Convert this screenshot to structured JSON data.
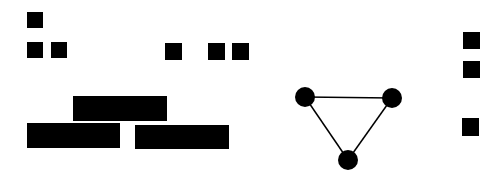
{
  "canvas": {
    "width": 503,
    "height": 177,
    "background": "#ffffff",
    "foreground": "#000000"
  },
  "squares": [
    {
      "id": "sq-top-left",
      "x": 27,
      "y": 12,
      "w": 16,
      "h": 16
    },
    {
      "id": "sq-row2-a",
      "x": 27,
      "y": 42,
      "w": 16,
      "h": 16
    },
    {
      "id": "sq-row2-b",
      "x": 51,
      "y": 42,
      "w": 16,
      "h": 16
    },
    {
      "id": "sq-mid-a",
      "x": 165,
      "y": 43,
      "w": 17,
      "h": 17
    },
    {
      "id": "sq-mid-b",
      "x": 208,
      "y": 43,
      "w": 17,
      "h": 17
    },
    {
      "id": "sq-mid-c",
      "x": 232,
      "y": 43,
      "w": 17,
      "h": 17
    },
    {
      "id": "sq-right-a",
      "x": 463,
      "y": 32,
      "w": 17,
      "h": 17
    },
    {
      "id": "sq-right-b",
      "x": 463,
      "y": 61,
      "w": 17,
      "h": 17
    },
    {
      "id": "sq-right-c",
      "x": 462,
      "y": 118,
      "w": 17,
      "h": 18
    }
  ],
  "bars": [
    {
      "id": "bar-top",
      "x": 73,
      "y": 96,
      "w": 94,
      "h": 25
    },
    {
      "id": "bar-bottom-left",
      "x": 27,
      "y": 123,
      "w": 93,
      "h": 25
    },
    {
      "id": "bar-bottom-right",
      "x": 135,
      "y": 125,
      "w": 94,
      "h": 24
    }
  ],
  "graph": {
    "nodes": [
      {
        "id": "node-a",
        "cx": 305,
        "cy": 97,
        "r": 10
      },
      {
        "id": "node-b",
        "cx": 392,
        "cy": 98,
        "r": 10
      },
      {
        "id": "node-c",
        "cx": 348,
        "cy": 160,
        "r": 10
      }
    ],
    "edges": [
      {
        "from": "node-a",
        "to": "node-b"
      },
      {
        "from": "node-a",
        "to": "node-c"
      },
      {
        "from": "node-b",
        "to": "node-c"
      }
    ],
    "edge_width": 1.5
  }
}
